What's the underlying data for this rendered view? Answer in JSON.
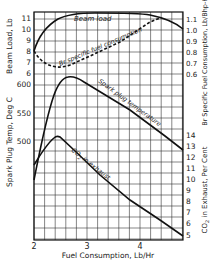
{
  "chart_data": {
    "type": "line",
    "title": "",
    "xlabel": "Fuel Consumption, Lb/Hr",
    "xlim": [
      2,
      4.8
    ],
    "x_ticks": [
      2,
      3,
      4
    ],
    "grid": true,
    "axes": {
      "left_top": {
        "label": "Beam Load, Lb",
        "ticks": [
          6,
          7,
          8,
          9,
          10,
          11
        ]
      },
      "left_bottom": {
        "label": "Spark Plug Temp, Deg C",
        "ticks": [
          500,
          550,
          600
        ]
      },
      "right_top": {
        "label": "Br Specific Fuel Consumption, Lb/Bhp-Hr",
        "ticks": [
          0.6,
          0.7,
          0.8,
          0.9,
          1.0,
          1.1
        ]
      },
      "right_bottom": {
        "label": "CO2 in Exhaust, Per Cent",
        "ticks": [
          5,
          6,
          7,
          8,
          9,
          10,
          11,
          12,
          13,
          14
        ]
      }
    },
    "series": [
      {
        "name": "Beam load",
        "axis": "left_top",
        "style": "solid",
        "x": [
          2.0,
          2.2,
          2.4,
          2.6,
          2.8,
          3.0,
          3.4,
          3.8,
          4.2,
          4.5,
          4.8
        ],
        "values": [
          8.0,
          9.4,
          10.3,
          10.8,
          11.1,
          11.25,
          11.3,
          11.25,
          11.1,
          10.8,
          10.0
        ]
      },
      {
        "name": "Br specific fuel consumption",
        "axis": "right_top",
        "style": "dashed",
        "x": [
          2.0,
          2.1,
          2.2,
          2.4,
          2.6,
          3.0,
          3.4,
          3.8,
          4.2
        ],
        "values": [
          0.8,
          0.72,
          0.68,
          0.66,
          0.7,
          0.78,
          0.88,
          0.97,
          1.1
        ]
      },
      {
        "name": "Spark plug temperature",
        "axis": "left_bottom",
        "style": "solid",
        "x": [
          2.0,
          2.2,
          2.4,
          2.55,
          2.7,
          3.0,
          3.5,
          4.0,
          4.5,
          4.8
        ],
        "values": [
          430,
          515,
          580,
          605,
          608,
          590,
          550,
          510,
          475,
          452
        ]
      },
      {
        "name": "CO2 in exhaust",
        "axis": "right_bottom",
        "style": "solid",
        "x": [
          2.0,
          2.2,
          2.4,
          2.5,
          2.7,
          3.0,
          3.5,
          4.0,
          4.5,
          4.8
        ],
        "values": [
          11.3,
          12.8,
          13.8,
          13.9,
          13.2,
          11.8,
          9.6,
          7.6,
          6.0,
          5.0
        ]
      }
    ],
    "annotations": [
      "Beam load",
      "Br specific fuel consumption",
      "Spark plug temperature",
      "CO2 in exhaust"
    ]
  },
  "labels": {
    "xlabel": "Fuel Consumption, Lb/Hr",
    "beam_axis": "Beam Load, Lb",
    "temp_axis": "Spark Plug Temp, Deg C",
    "bsfc_axis": "Br Specific Fuel Consumption, Lb/Bhp-Hr",
    "co2_axis": "CO",
    "co2_axis_sub": "2",
    "co2_axis_rest": " in Exhaust, Per Cent",
    "beam_curve": "Beam load",
    "bsfc_curve": "Br specific fuel consumption",
    "spark_curve": "Spark plug temperature",
    "co2_curve": "CO",
    "co2_curve_sub": "2",
    "co2_curve_rest": " in exhaust",
    "x_ticks": [
      "2",
      "3",
      "4"
    ],
    "beam_ticks": [
      "11",
      "10",
      "9",
      "8",
      "7",
      "6"
    ],
    "temp_ticks": [
      "600",
      "550",
      "500"
    ],
    "bsfc_ticks": [
      "1.1",
      "1.0",
      "0.9",
      "0.8",
      "0.7",
      "0.6"
    ],
    "co2_ticks": [
      "14",
      "13",
      "12",
      "11",
      "10",
      "9",
      "8",
      "7",
      "6",
      "5"
    ]
  }
}
